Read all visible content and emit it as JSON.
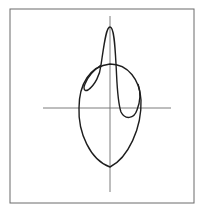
{
  "figure": {
    "colors": {
      "background": "#ffffff",
      "frame": "#6a6a6a",
      "axes": "#6e6e6e",
      "curve": "#1e1e1e"
    },
    "frame": {
      "x": 10,
      "y": 9,
      "width": 184,
      "height": 194
    },
    "horizontal_axis": {
      "x1": 43,
      "y1": 108,
      "x2": 171,
      "y2": 108
    },
    "vertical_axis": {
      "x1": 110,
      "y1": 16,
      "x2": 110,
      "y2": 192
    },
    "outer_curve_path": "M110,167 C90,160 78,132 79,108 C79,84 90,66 110,64 C128,64 140,80 141,100 C142,128 128,158 110,167 Z",
    "inner_curve_path": "M101,65 C104,45 106,27 110,27 C114,27 115,45 116,64 C117,80 117,100 121,112 C125,120 134,119 137,110 C141,100 140,90 138,84 M101,65 C100,75 95,85 88,90 C84,92 83,88 85,84 C88,76 94,70 101,65"
  }
}
